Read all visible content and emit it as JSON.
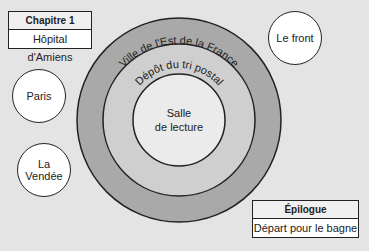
{
  "chapter_box": {
    "header": "Chapitre 1",
    "body": "Hôpital d'Amiens"
  },
  "epilogue_box": {
    "header": "Épilogue",
    "body": "Départ pour le bagne"
  },
  "rings": {
    "outer": "Ville de l'Est de la France",
    "middle": "Dépôt du tri postal",
    "inner_line1": "Salle",
    "inner_line2": "de lecture"
  },
  "bubbles": {
    "front": "Le front",
    "paris": "Paris",
    "vendee": "La Vendée"
  },
  "colors": {
    "background": "#e4e4e4",
    "outer_ring": "#a9a9a9",
    "middle_ring": "#cfcfcf",
    "inner": "#ebebeb",
    "stroke": "#222222"
  }
}
